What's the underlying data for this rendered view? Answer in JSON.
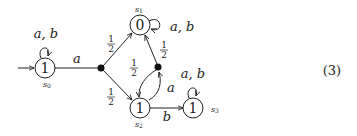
{
  "diagram": {
    "type": "probabilistic automaton",
    "equation_number": "(3)",
    "states": [
      {
        "id": "s0",
        "name": "s",
        "sub": "0",
        "value": "1",
        "initial": true,
        "loop_label": "a, b"
      },
      {
        "id": "s1",
        "name": "s",
        "sub": "1",
        "value": "0",
        "loop_label": "a, b"
      },
      {
        "id": "s2",
        "name": "s",
        "sub": "2",
        "value": "1"
      },
      {
        "id": "s3",
        "name": "s",
        "sub": "3",
        "value": "1",
        "loop_label": "a, b"
      }
    ],
    "edges": [
      {
        "from": "s0",
        "to": "dist1",
        "label": "a"
      },
      {
        "from": "dist1",
        "to": "s1",
        "label": "1/2"
      },
      {
        "from": "dist1",
        "to": "s2",
        "label": "1/2"
      },
      {
        "from": "s2",
        "to": "dist2",
        "label": "a"
      },
      {
        "from": "dist2",
        "to": "s1",
        "label": "1/2"
      },
      {
        "from": "dist2",
        "to": "s2",
        "label": "1/2"
      },
      {
        "from": "s2",
        "to": "s3",
        "label": "b"
      }
    ],
    "labels": {
      "loop_ab": "a, b",
      "a": "a",
      "b": "b",
      "half_num": "1",
      "half_den": "2",
      "one": "1",
      "zero": "0",
      "s": "s",
      "sub0": "0",
      "sub1": "1",
      "sub2": "2",
      "sub3": "3"
    }
  }
}
